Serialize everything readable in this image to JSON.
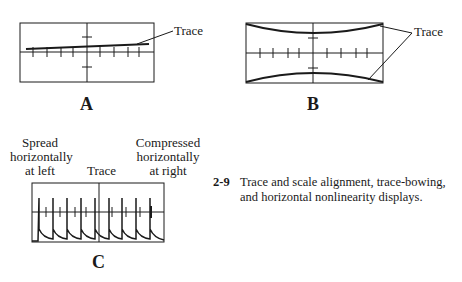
{
  "figure": {
    "number": "2-9",
    "caption_line1": "Trace and scale alignment, trace-bowing,",
    "caption_line2": "and horizontal nonlinearity displays."
  },
  "panels": {
    "a": {
      "letter": "A",
      "trace_label": "Trace"
    },
    "b": {
      "letter": "B",
      "trace_label": "Trace"
    },
    "c": {
      "letter": "C",
      "trace_label": "Trace",
      "left_label": [
        "Spread",
        "horizontally",
        "at left"
      ],
      "right_label": [
        "Compressed",
        "horizontally",
        "at right"
      ]
    }
  },
  "colors": {
    "line": "#1a1a1a",
    "background": "#ffffff"
  }
}
